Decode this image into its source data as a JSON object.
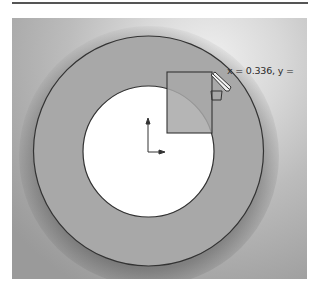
{
  "viewport": {
    "background": "#b9b9b9",
    "ring_fill": "#a9a9a9",
    "hole_fill": "#ffffff",
    "stroke": "#333333"
  },
  "cursor_readout": {
    "text": "x = 0.336, y ="
  },
  "icons": {
    "origin": "origin-axes-icon",
    "pencil": "pencil-icon",
    "sketch_cursor": "rectangle-cursor-icon"
  }
}
